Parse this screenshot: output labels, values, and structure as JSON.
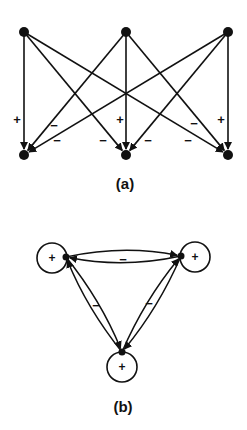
{
  "panel_a": {
    "caption": "(a)",
    "top_nodes": [
      {
        "x": 24,
        "y": 32
      },
      {
        "x": 126,
        "y": 32
      },
      {
        "x": 228,
        "y": 32
      }
    ],
    "bottom_nodes": [
      {
        "x": 24,
        "y": 155
      },
      {
        "x": 126,
        "y": 155
      },
      {
        "x": 228,
        "y": 155
      }
    ],
    "edges": [
      {
        "from": 0,
        "to": 0,
        "sign": "+"
      },
      {
        "from": 0,
        "to": 1,
        "sign": "−"
      },
      {
        "from": 0,
        "to": 2,
        "sign": "−"
      },
      {
        "from": 1,
        "to": 0,
        "sign": "−"
      },
      {
        "from": 1,
        "to": 1,
        "sign": "+"
      },
      {
        "from": 1,
        "to": 2,
        "sign": "−"
      },
      {
        "from": 2,
        "to": 0,
        "sign": "−"
      },
      {
        "from": 2,
        "to": 1,
        "sign": "−"
      },
      {
        "from": 2,
        "to": 2,
        "sign": "+"
      }
    ],
    "labels": [
      {
        "text": "+",
        "x": 17,
        "y": 124
      },
      {
        "text": "−",
        "x": 54,
        "y": 130
      },
      {
        "text": "−",
        "x": 57,
        "y": 145
      },
      {
        "text": "−",
        "x": 103,
        "y": 145
      },
      {
        "text": "+",
        "x": 120,
        "y": 124
      },
      {
        "text": "−",
        "x": 148,
        "y": 145
      },
      {
        "text": "−",
        "x": 194,
        "y": 128
      },
      {
        "text": "−",
        "x": 188,
        "y": 145
      },
      {
        "text": "+",
        "x": 221,
        "y": 124
      }
    ]
  },
  "panel_b": {
    "caption": "(b)",
    "nodes": [
      {
        "x": 66,
        "y": 257
      },
      {
        "x": 181,
        "y": 256
      },
      {
        "x": 122,
        "y": 352
      }
    ],
    "self_loops": [
      {
        "cx": 52,
        "cy": 258,
        "r": 15,
        "sign": "+"
      },
      {
        "cx": 195,
        "cy": 257,
        "r": 15,
        "sign": "+"
      },
      {
        "cx": 122,
        "cy": 367,
        "r": 15,
        "sign": "+"
      }
    ],
    "edge_labels": [
      {
        "text": "−",
        "x": 123,
        "y": 264
      },
      {
        "text": "−",
        "x": 96,
        "y": 310
      },
      {
        "text": "−",
        "x": 149,
        "y": 308
      }
    ]
  }
}
